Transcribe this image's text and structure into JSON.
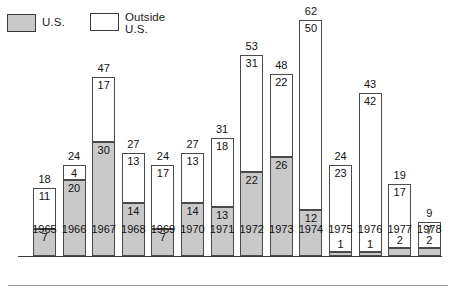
{
  "legend": {
    "items": [
      {
        "key": "us",
        "label": "U.S.",
        "swatch": "gray-filled-square",
        "color": "#c9c9c9"
      },
      {
        "key": "outside",
        "label": "Outside\nU.S.",
        "swatch": "white-outline-square",
        "color": "#ffffff"
      }
    ]
  },
  "chart_data": {
    "type": "bar",
    "stacked": true,
    "title": "",
    "xlabel": "",
    "ylabel": "",
    "grid": false,
    "legend_position": "top-left",
    "ylim": [
      0,
      62
    ],
    "categories": [
      "1965",
      "1966",
      "1967",
      "1968",
      "1969",
      "1970",
      "1971",
      "1972",
      "1973",
      "1974",
      "1975",
      "1976",
      "1977",
      "1978"
    ],
    "series": [
      {
        "name": "U.S.",
        "color": "#c9c9c9",
        "values": [
          7,
          20,
          30,
          14,
          7,
          14,
          13,
          22,
          26,
          12,
          1,
          1,
          2,
          2
        ]
      },
      {
        "name": "Outside U.S.",
        "color": "#ffffff",
        "values": [
          11,
          4,
          17,
          13,
          17,
          13,
          18,
          31,
          22,
          50,
          23,
          42,
          17,
          7
        ]
      }
    ],
    "totals": [
      18,
      24,
      47,
      27,
      24,
      27,
      31,
      53,
      48,
      62,
      24,
      43,
      19,
      9
    ],
    "annotations": "Each bar is labeled with its total above the bar; each segment is labeled with its own value."
  }
}
